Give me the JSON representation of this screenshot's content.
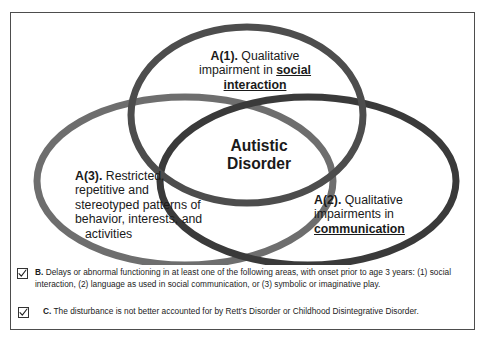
{
  "diagram": {
    "center_label_line1": "Autistic",
    "center_label_line2": "Disorder",
    "circles": [
      {
        "id": "a1",
        "tag": "A(1).",
        "text_plain": "A(1). Qualitative impairment in social interaction",
        "lead": "A(1).",
        "body": " Qualitative impairment in ",
        "emphasis": "social interaction",
        "stroke_color": "#4d4d4d"
      },
      {
        "id": "a3",
        "tag": "A(3).",
        "text_plain": "A(3). Restricted, repetitive and stereotyped patterns of behavior, interests, and activities",
        "lead": "A(3).",
        "line1": " Restricted,",
        "line2": "repetitive and",
        "line3": "stereotyped patterns of",
        "line4": "behavior, interests, and",
        "line5": "activities",
        "stroke_color": "#6e6e6e"
      },
      {
        "id": "a2",
        "tag": "A(2).",
        "text_plain": "A(2). Qualitative impairments in communication",
        "lead": "A(2).",
        "body": " Qualitative impairments in ",
        "emphasis": "communication",
        "stroke_color": "#3a3a3a"
      }
    ]
  },
  "criteria": [
    {
      "id": "b",
      "checked": true,
      "checkbox_icon": "checked-checkbox-icon",
      "label": "B.",
      "text": " Delays or abnormal functioning in at least one of the  following areas, with onset prior to age 3 years: (1) social interaction, (2) language as used in social communication, or (3) symbolic or imaginative play."
    },
    {
      "id": "c",
      "checked": true,
      "checkbox_icon": "checked-checkbox-icon",
      "label": "C.",
      "text": " The disturbance is not better accounted for by Rett’s Disorder or Childhood Disintegrative Disorder."
    }
  ],
  "colors": {
    "frame": "#4d4d4d",
    "background": "#ffffff",
    "text": "#1a1a1a",
    "circle_top": "#4d4d4d",
    "circle_left": "#6e6e6e",
    "circle_right": "#3a3a3a"
  }
}
